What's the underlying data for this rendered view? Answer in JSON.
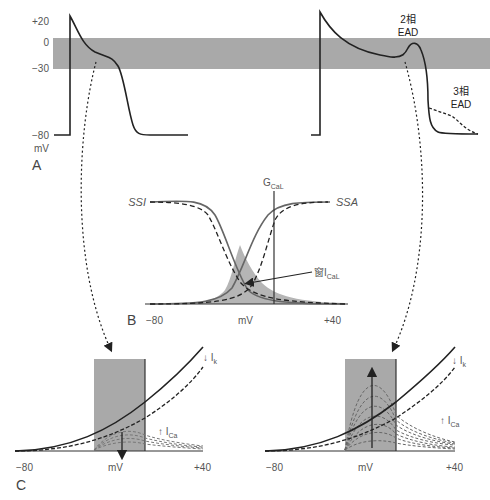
{
  "panel_a": {
    "label": "A",
    "y_ticks": [
      "+20",
      "0",
      "−30",
      "−80"
    ],
    "y_unit": "mV",
    "band_color": "#a9a9a9",
    "right_annotations": {
      "phase2": {
        "line1": "2相",
        "line2": "EAD"
      },
      "phase3": {
        "line1": "3相",
        "line2": "EAD"
      }
    }
  },
  "panel_b": {
    "label": "B",
    "curve_left": "SSI",
    "curve_right": "SSA",
    "conductance_label": "G",
    "conductance_sub": "CaL",
    "window_label": "窗I",
    "window_sub": "CaL",
    "x_ticks": [
      "−80",
      "mV",
      "+40"
    ],
    "fill_color": "#b5b5b5"
  },
  "panel_c": {
    "label": "C",
    "left": {
      "x_ticks": [
        "−80",
        "mV",
        "+40"
      ],
      "ik_label": "↓ I",
      "ik_sub": "k",
      "ica_label": "↑ I",
      "ica_sub": "Ca",
      "arrow_direction": "down"
    },
    "right": {
      "x_ticks": [
        "−80",
        "mV",
        "+40"
      ],
      "ik_label": "↓ I",
      "ik_sub": "k",
      "ica_label": "↑ I",
      "ica_sub": "Ca",
      "arrow_direction": "up"
    },
    "window_color": "#a9a9a9"
  }
}
